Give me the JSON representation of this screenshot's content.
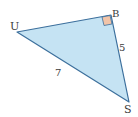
{
  "diagram": {
    "type": "right-triangle",
    "fill_color": "#c5e3f3",
    "stroke_color": "#3c6f9c",
    "right_angle_marker_color": "#f2c4a8",
    "vertices": [
      {
        "label": "U",
        "x": 17,
        "y": 32
      },
      {
        "label": "B",
        "x": 111,
        "y": 15
      },
      {
        "label": "S",
        "x": 129,
        "y": 102
      }
    ],
    "right_angle_at": "B",
    "sides": [
      {
        "from": "B",
        "to": "S",
        "label": "5"
      },
      {
        "from": "U",
        "to": "S",
        "label": "7"
      }
    ]
  }
}
